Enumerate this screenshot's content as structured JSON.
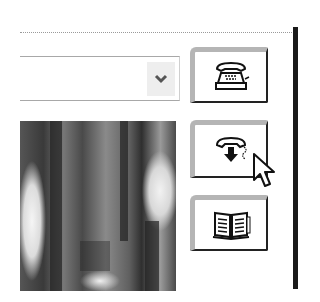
{
  "dropdown": {
    "value": "",
    "chevron_icon": "chevron-down"
  },
  "toolbar": {
    "buttons": [
      {
        "name": "phone-button",
        "icon": "telephone"
      },
      {
        "name": "call-forward-button",
        "icon": "telephone-down-arrow"
      },
      {
        "name": "phonebook-button",
        "icon": "open-book"
      }
    ]
  },
  "image": {
    "description": "grayscale photo"
  },
  "cursor": {
    "type": "arrow",
    "hovering": "call-forward-button"
  },
  "colors": {
    "border_dark": "#222222",
    "border_light": "#b5b5b5",
    "dropdown_button_bg": "#eeeeee"
  }
}
